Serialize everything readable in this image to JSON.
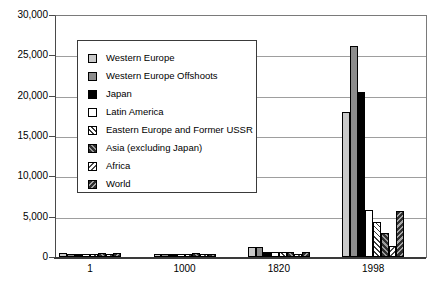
{
  "chart_data": {
    "type": "bar",
    "title": "",
    "xlabel": "",
    "ylabel": "",
    "categories": [
      "1",
      "1000",
      "1820",
      "1998"
    ],
    "series": [
      {
        "name": "Western Europe",
        "pattern": "light-gray",
        "values": [
          450,
          400,
          1232,
          17921
        ]
      },
      {
        "name": "Western Europe Offshoots",
        "pattern": "dark-gray",
        "values": [
          400,
          400,
          1201,
          26146
        ]
      },
      {
        "name": "Japan",
        "pattern": "black",
        "values": [
          400,
          425,
          669,
          20413
        ]
      },
      {
        "name": "Latin America",
        "pattern": "white",
        "values": [
          400,
          400,
          665,
          5795
        ]
      },
      {
        "name": "Eastern Europe and Former USSR",
        "pattern": "hatch-fwd-light",
        "values": [
          400,
          400,
          667,
          4354
        ]
      },
      {
        "name": "Asia (excluding Japan)",
        "pattern": "hatch-fwd-dark",
        "values": [
          450,
          450,
          575,
          2936
        ]
      },
      {
        "name": "Africa",
        "pattern": "hatch-back-light",
        "values": [
          425,
          416,
          418,
          1368
        ]
      },
      {
        "name": "World",
        "pattern": "hatch-back-dark",
        "values": [
          444,
          435,
          667,
          5709
        ]
      }
    ],
    "ylim": [
      0,
      30000
    ],
    "yticks": [
      0,
      5000,
      10000,
      15000,
      20000,
      25000,
      30000
    ],
    "ytick_labels": [
      "0",
      "5,000",
      "10,000",
      "15,000",
      "20,000",
      "25,000",
      "30,000"
    ],
    "grid": "horizontal",
    "legend_position": "inside-top-left"
  },
  "colors": {
    "background": "#ffffff",
    "gridline": "#9e9e9e",
    "axis": "#3a3a3a",
    "frame": "#7a7a7a",
    "bar_light_gray": "#c9c9c9",
    "bar_dark_gray": "#8d8d8d",
    "bar_black": "#000000",
    "bar_white": "#ffffff",
    "text": "#000000"
  }
}
